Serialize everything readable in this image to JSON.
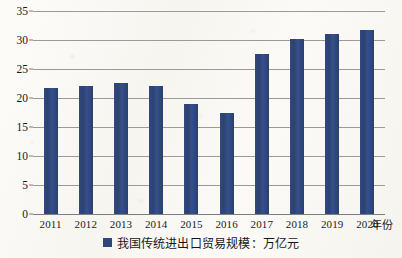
{
  "chart_data": {
    "type": "bar",
    "title": "",
    "subtitle": "",
    "xlabel": "年份",
    "ylabel": "",
    "categories": [
      "2011",
      "2012",
      "2013",
      "2014",
      "2015",
      "2016",
      "2017",
      "2018",
      "2019",
      "2020"
    ],
    "values": [
      21.8,
      22.1,
      22.6,
      22.1,
      18.9,
      17.4,
      27.6,
      30.2,
      31.1,
      31.7
    ],
    "series": [
      {
        "name": "我国传统进出口贸易规模：万亿元",
        "color": "#2f4679",
        "values": [
          21.8,
          22.1,
          22.6,
          22.1,
          18.9,
          17.4,
          27.6,
          30.2,
          31.1,
          31.7
        ]
      }
    ],
    "ylim": [
      0,
      35
    ],
    "ytick_values": [
      0,
      5,
      10,
      15,
      20,
      25,
      30,
      35
    ],
    "ytick_labels": [
      "0",
      "5",
      "10",
      "15",
      "20",
      "25",
      "30",
      "35"
    ],
    "grid": true,
    "grid_axis": "y",
    "legend": {
      "position": "bottom",
      "entries": [
        {
          "label": "我国传统进出口贸易规模：万亿元",
          "color": "#2f4679",
          "marker": "square"
        }
      ]
    },
    "units": "万亿元",
    "bar_color": "#2f4679",
    "background_color": "#fbfaf7",
    "gridline_color": "#9a9a98"
  }
}
